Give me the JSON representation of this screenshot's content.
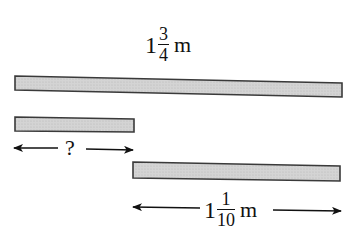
{
  "diagram": {
    "type": "length-comparison-bars",
    "colors": {
      "bar_fill": "#cfcfcf",
      "bar_stroke": "#3a3a3a",
      "text": "#111111"
    },
    "top_label": {
      "whole": "1",
      "numerator": "3",
      "denominator": "4",
      "unit": "m"
    },
    "bars": [
      {
        "name": "total-length-bar",
        "label": "1 3/4 m"
      },
      {
        "name": "unknown-length-bar",
        "label": "?"
      },
      {
        "name": "known-length-bar",
        "label": "1 1/10 m"
      }
    ],
    "unknown_label": "?",
    "bottom_label": {
      "whole": "1",
      "numerator": "1",
      "denominator": "10",
      "unit": "m"
    }
  }
}
